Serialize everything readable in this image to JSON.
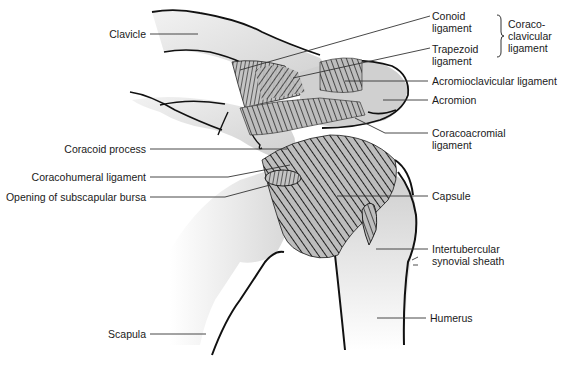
{
  "figure": {
    "type": "anatomical-diagram"
  },
  "labels": {
    "clavicle": "Clavicle",
    "conoid_line1": "Conoid",
    "conoid_line2": "ligament",
    "trapezoid_line1": "Trapezoid",
    "trapezoid_line2": "ligament",
    "coracoclavicular_line1": "Coraco-",
    "coracoclavicular_line2": "clavicular",
    "coracoclavicular_line3": "ligament",
    "acromioclavicular": "Acromioclavicular ligament",
    "acromion": "Acromion",
    "coracoacromial_line1": "Coracoacromial",
    "coracoacromial_line2": "ligament",
    "coracoid_process": "Coracoid process",
    "coracohumeral": "Coracohumeral ligament",
    "subscapular_bursa": "Opening of subscapular bursa",
    "capsule": "Capsule",
    "intertubercular_line1": "Intertubercular",
    "intertubercular_line2": "synovial sheath",
    "scapula": "Scapula",
    "humerus": "Humerus"
  },
  "colors": {
    "outline": "#111111",
    "bone_fill": "#d9d9d9",
    "ligament_stroke": "#2a2a2a",
    "leader_line": "#333333",
    "text": "#1a1a1a"
  }
}
